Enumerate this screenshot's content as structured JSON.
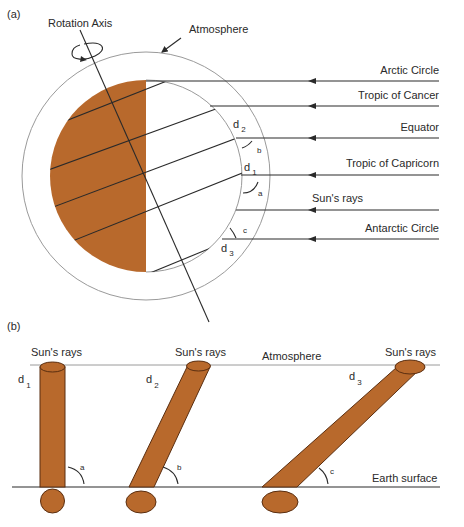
{
  "colors": {
    "earth_shade": "#b8692c",
    "outline": "#2a2a2a",
    "atmosphere_line": "#9a9a9a",
    "background": "#ffffff"
  },
  "panel_a": {
    "label": "(a)",
    "rotation_axis_label": "Rotation Axis",
    "atmosphere_label": "Atmosphere",
    "rays": [
      {
        "label": "Arctic Circle"
      },
      {
        "label": "Tropic of Cancer"
      },
      {
        "label": "Equator"
      },
      {
        "label": "Tropic of Capricorn"
      },
      {
        "label": "Sun's rays"
      },
      {
        "label": "Antarctic Circle"
      }
    ],
    "distance_labels": {
      "d1": "d",
      "d1_sub": "1",
      "d2": "d",
      "d2_sub": "2",
      "d3": "d",
      "d3_sub": "3"
    },
    "angle_labels": {
      "a": "a",
      "b": "b",
      "c": "c"
    }
  },
  "panel_b": {
    "label": "(b)",
    "atmosphere_label": "Atmosphere",
    "earth_surface_label": "Earth surface",
    "beams": [
      {
        "top_label": "Sun's rays",
        "d": "d",
        "d_sub": "1",
        "angle": "a"
      },
      {
        "top_label": "Sun's rays",
        "d": "d",
        "d_sub": "2",
        "angle": "b"
      },
      {
        "top_label": "Sun's rays",
        "d": "d",
        "d_sub": "3",
        "angle": "c"
      }
    ]
  }
}
